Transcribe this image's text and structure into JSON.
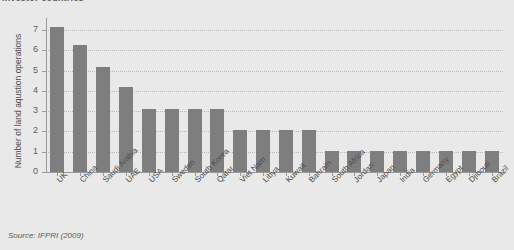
{
  "chart_data": {
    "type": "bar",
    "title": "investor countries",
    "subtitle": "",
    "xlabel": "",
    "ylabel": "Number of land aqustion operations",
    "ylim": [
      0,
      7.6
    ],
    "yticks": [
      0,
      1,
      2,
      3,
      4,
      5,
      6,
      7
    ],
    "ytick_labels": [
      "0",
      "1",
      "2",
      "3",
      "4",
      "5",
      "6",
      "7"
    ],
    "grid": true,
    "legend": false,
    "legend_position": "none",
    "bar_color": "#7e7e7e",
    "background_color": "#e9e9e9",
    "gridline_color": "#b9b9b9",
    "axis_color": "#9a9a9a",
    "categories": [
      "UK",
      "China",
      "Saudi Arabia",
      "UAE",
      "USA",
      "Sweden",
      "South Korea",
      "Qatar",
      "Viet Nam",
      "Libya",
      "Kuwait",
      "Bahrain",
      "South Africa",
      "Jordan",
      "Japan",
      "India",
      "Germany",
      "Egypt",
      "Djibouti",
      "Brazil"
    ],
    "values": [
      7.15,
      6.25,
      5.2,
      4.2,
      3.1,
      3.1,
      3.1,
      3.1,
      2.05,
      2.05,
      2.05,
      2.05,
      1.05,
      1.05,
      1.05,
      1.05,
      1.05,
      1.05,
      1.05,
      1.05
    ]
  },
  "source": {
    "note": "Source: IFPRI (2009)"
  }
}
